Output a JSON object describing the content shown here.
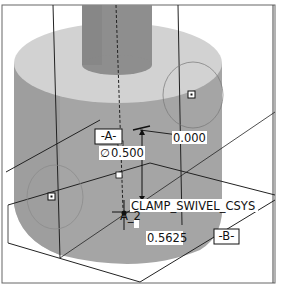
{
  "viewport": {
    "description": "CAD model view of clamp swivel cylinder with datum annotations",
    "colors": {
      "background": "#ffffff",
      "cylinder_side": "#a9a9a9",
      "cylinder_top": "#d4d4d4",
      "boss": "#8f8f8f",
      "edge": "#222222",
      "frame": "#555555"
    }
  },
  "annotations": {
    "datum_a": "-A-",
    "datum_b": "-B-",
    "diameter_symbol": "∅",
    "diameter_value": "0.500",
    "dimension_top": "0.000",
    "dimension_bottom": "0.5625",
    "csys_name": "CLAMP_SWIVEL_CSYS",
    "axis_label": "A_2"
  },
  "icons": {
    "datum_point": "datum-point-icon",
    "csys": "coordinate-system-icon"
  }
}
